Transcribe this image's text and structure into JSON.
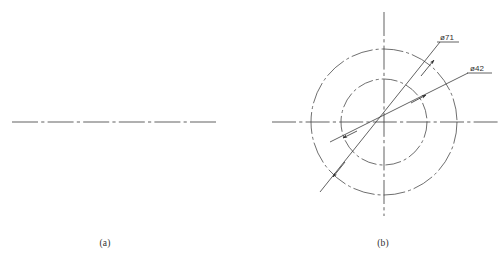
{
  "figure": {
    "background_color": "#ffffff",
    "line_color": "#3a3a3a",
    "centerline_color": "#4a4a4a",
    "width": 503,
    "height": 263
  },
  "panel_a": {
    "caption": "(a)",
    "caption_x": 105,
    "caption_y": 246,
    "centerline": {
      "name": "horizontal-center-line",
      "x1": 12,
      "y1": 122,
      "x2": 216,
      "y2": 122,
      "style": "dash-dot"
    }
  },
  "panel_b": {
    "caption": "(b)",
    "caption_x": 383,
    "caption_y": 246,
    "center": {
      "x": 384,
      "y": 122
    },
    "circles": [
      {
        "name": "outer-bolt-circle",
        "radius": 73,
        "style": "dash-dot",
        "dimension": "ø71"
      },
      {
        "name": "inner-bolt-circle",
        "radius": 43,
        "style": "dash-dot",
        "dimension": "ø42"
      }
    ],
    "center_lines": {
      "horizontal": {
        "x1": 272,
        "y1": 122,
        "x2": 500,
        "y2": 122,
        "style": "dash-dot"
      },
      "vertical": {
        "x1": 384,
        "y1": 12,
        "x2": 384,
        "y2": 216,
        "style": "dash-dot"
      }
    },
    "dimensions": [
      {
        "name": "diameter-71",
        "label": "ø71",
        "value": 71,
        "symbol": "ø",
        "label_x": 440,
        "label_y": 40,
        "leader_x1": 437,
        "leader_y1": 42,
        "leader_x2": 459,
        "leader_y2": 42,
        "angle_deg": 30,
        "arrow_near": {
          "x": 335,
          "y": 175
        },
        "arrow_far": {
          "x": 432,
          "y": 62
        }
      },
      {
        "name": "diameter-42",
        "label": "ø42",
        "value": 42,
        "symbol": "ø",
        "label_x": 470,
        "label_y": 71,
        "leader_x1": 467,
        "leader_y1": 73,
        "leader_x2": 492,
        "leader_y2": 73,
        "angle_deg": 20,
        "arrow_near": {
          "x": 345,
          "y": 137
        },
        "arrow_far": {
          "x": 424,
          "y": 96
        }
      }
    ]
  }
}
